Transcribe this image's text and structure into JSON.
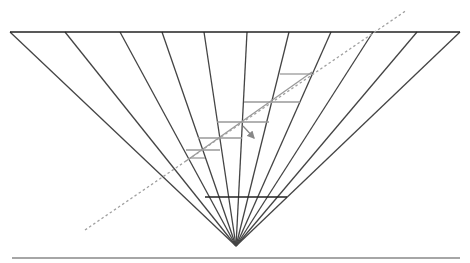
{
  "diagram": {
    "title": "",
    "width": 470,
    "height": 263,
    "colors": {
      "background": "#ffffff",
      "fan_lines": "#444444",
      "top_line": "#222222",
      "bottom_line": "#888888",
      "step_lines": "#999999",
      "diagonal": "#999999",
      "dashed": "#a0a0a0",
      "arrow": "#888888"
    },
    "apex": [
      236,
      246
    ],
    "top_line": {
      "x1": 10,
      "y1": 32,
      "x2": 460,
      "y2": 32
    },
    "bottom_line": {
      "x1": 12,
      "y1": 258,
      "x2": 460,
      "y2": 258
    },
    "inner_horizontal": {
      "x1": 205,
      "y1": 197,
      "x2": 287,
      "y2": 197
    },
    "fan_top_x": [
      10,
      65,
      120,
      162,
      204,
      247,
      289,
      331,
      373,
      417,
      460
    ],
    "dashed_line": {
      "x1": 85,
      "y1": 230,
      "x2": 407,
      "y2": 10
    },
    "diagonal_solid": {
      "x1": 186,
      "y1": 161,
      "x2": 312,
      "y2": 72
    },
    "steps": [
      {
        "x1": 280,
        "x2": 312,
        "y": 74
      },
      {
        "x1": 244,
        "x2": 300,
        "y": 102
      },
      {
        "x1": 217,
        "x2": 269,
        "y": 122
      },
      {
        "x1": 198,
        "x2": 242,
        "y": 138
      },
      {
        "x1": 186,
        "x2": 220,
        "y": 150
      },
      {
        "x1": 190,
        "x2": 205,
        "y": 158
      }
    ],
    "arrow": {
      "x1": 243,
      "y1": 126,
      "x2": 254,
      "y2": 138
    }
  }
}
